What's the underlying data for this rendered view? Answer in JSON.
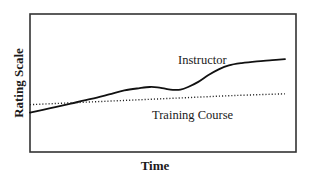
{
  "chart_data": {
    "type": "line",
    "title": "",
    "subtitle": "",
    "xlabel": "Time",
    "ylabel": "Rating Scale",
    "xlim": [
      0,
      100
    ],
    "ylim": [
      0,
      100
    ],
    "grid": false,
    "xticks": [],
    "yticks": [],
    "xticklabels": [],
    "yticklabels": [],
    "legend_position": "inline-annotation",
    "frame": {
      "color": "#333333",
      "visible": true,
      "x0_px": 30,
      "y0_px": 14,
      "x1_px": 296,
      "y1_px": 152
    },
    "series": [
      {
        "name": "Instructor",
        "style": "solid",
        "color": "#111111",
        "width_px": 1.8,
        "label_text": "Instructor",
        "label_x_px": 178,
        "label_y_px": 64,
        "points": [
          {
            "x": 0,
            "y": 24
          },
          {
            "x": 8,
            "y": 28
          },
          {
            "x": 16,
            "y": 32
          },
          {
            "x": 24,
            "y": 36
          },
          {
            "x": 31,
            "y": 40
          },
          {
            "x": 37,
            "y": 43.5
          },
          {
            "x": 43,
            "y": 45.5
          },
          {
            "x": 47,
            "y": 46.5
          },
          {
            "x": 50,
            "y": 46.2
          },
          {
            "x": 53,
            "y": 45.0
          },
          {
            "x": 56,
            "y": 44.0
          },
          {
            "x": 59,
            "y": 44.2
          },
          {
            "x": 62,
            "y": 46.5
          },
          {
            "x": 66,
            "y": 51
          },
          {
            "x": 70,
            "y": 57
          },
          {
            "x": 74,
            "y": 62
          },
          {
            "x": 78,
            "y": 65.5
          },
          {
            "x": 83,
            "y": 67.5
          },
          {
            "x": 89,
            "y": 69
          },
          {
            "x": 95,
            "y": 70
          },
          {
            "x": 100,
            "y": 71
          }
        ]
      },
      {
        "name": "Training Course",
        "style": "dotted",
        "color": "#222222",
        "width_px": 1.4,
        "label_text": "Training Course",
        "label_x_px": 152,
        "label_y_px": 119,
        "points": [
          {
            "x": 0,
            "y": 31
          },
          {
            "x": 20,
            "y": 33
          },
          {
            "x": 40,
            "y": 35
          },
          {
            "x": 60,
            "y": 37
          },
          {
            "x": 80,
            "y": 39
          },
          {
            "x": 100,
            "y": 40.5
          }
        ]
      }
    ],
    "annotations": [
      {
        "text": "Instructor",
        "x_px": 178,
        "y_px": 64
      },
      {
        "text": "Training Course",
        "x_px": 152,
        "y_px": 119
      }
    ]
  },
  "axes": {
    "y_label": "Rating Scale",
    "x_label": "Time"
  },
  "colors": {
    "background": "#ffffff",
    "frame": "#333333",
    "instructor_line": "#111111",
    "training_course_line": "#222222",
    "text": "#1a1a1a"
  }
}
